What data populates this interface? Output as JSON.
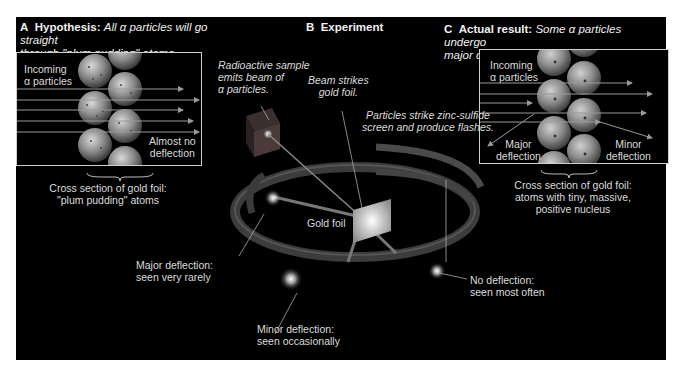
{
  "panel_a": {
    "letter": "A",
    "heading": "Hypothesis:",
    "caption": "All α particles will go straight through \"plum pudding\" atoms.",
    "caption_line1": "All α particles will go straight",
    "caption_line2": "through \"plum pudding\" atoms.",
    "label_incoming_1": "Incoming",
    "label_incoming_2": "α particles",
    "label_result_1": "Almost no",
    "label_result_2": "deflection",
    "cross_section_1": "Cross section of gold foil:",
    "cross_section_2": "\"plum pudding\" atoms"
  },
  "panel_b": {
    "letter": "B",
    "heading": "Experiment",
    "source_1": "Radioactive sample",
    "source_2": "emits beam of",
    "source_3": "α particles.",
    "beam_1": "Beam strikes",
    "beam_2": "gold foil.",
    "screen_1": "Particles strike zinc-sulfide",
    "screen_2": "screen and produce flashes.",
    "foil": "Gold foil",
    "major_1": "Major deflection:",
    "major_2": "seen very rarely",
    "minor_1": "Minor deflection:",
    "minor_2": "seen occasionally",
    "none_1": "No deflection:",
    "none_2": "seen most often"
  },
  "panel_c": {
    "letter": "C",
    "heading": "Actual result:",
    "caption_line1": "Some α particles undergo",
    "caption_line2": "major deflections by nuclear atoms.",
    "label_incoming_1": "Incoming",
    "label_incoming_2": "α particles",
    "label_major_1": "Major",
    "label_major_2": "deflection",
    "label_minor_1": "Minor",
    "label_minor_2": "deflection",
    "cross_section_1": "Cross section of gold foil:",
    "cross_section_2": "atoms with tiny, massive,",
    "cross_section_3": "positive nucleus"
  },
  "colors": {
    "background": "#000000",
    "frame": "#cfcfcf",
    "text": "#e0e0e0",
    "atom": "#9a9a9a",
    "ring": "#4a4a4a"
  }
}
